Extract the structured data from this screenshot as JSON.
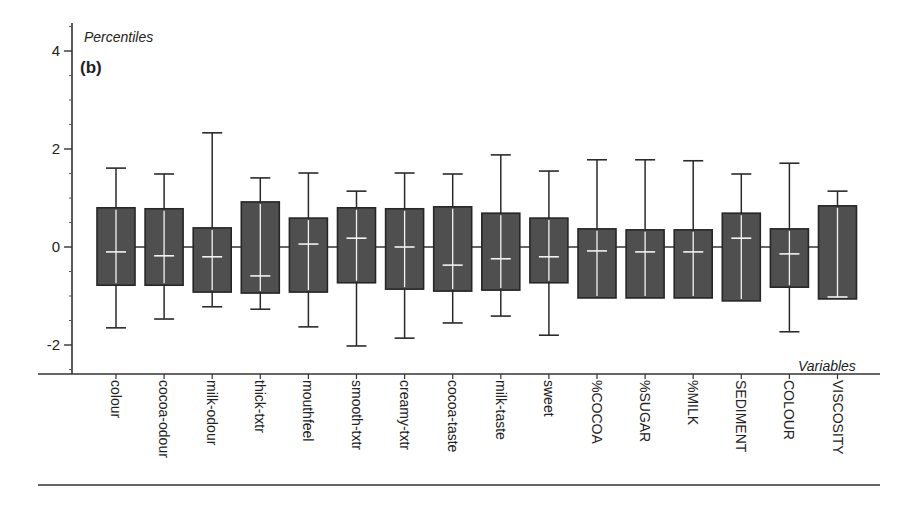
{
  "chart_data": {
    "type": "boxplot",
    "panel_label": "(b)",
    "title": "",
    "ylabel": "Percentiles",
    "xlabel": "Variables",
    "ylim": [
      -2.5,
      4.5
    ],
    "yticks": [
      4,
      2,
      0,
      -2
    ],
    "ytick_labels": [
      "4",
      "2",
      "0",
      "-2"
    ],
    "minor_tick_step": 0.5,
    "grid": false,
    "legend": null,
    "box_fill": "#4f4f4f",
    "box_edge": "#262626",
    "median_color": "#f2f2f2",
    "categories": [
      "colour",
      "cocoa-odour",
      "milk-odour",
      "thick-txtr",
      "mouthfeel",
      "smooth-txtr",
      "creamy-txtr",
      "cocoa-taste",
      "milk-taste",
      "sweet",
      "%COCOA",
      "%SUGAR",
      "%MILK",
      "SEDIMENT",
      "COLOUR",
      "VISCOSITY"
    ],
    "series": [
      {
        "name": "colour",
        "min": -1.65,
        "q1": -0.78,
        "median": -0.1,
        "q3": 0.8,
        "max": 1.61
      },
      {
        "name": "cocoa-odour",
        "min": -1.47,
        "q1": -0.78,
        "median": -0.18,
        "q3": 0.78,
        "max": 1.49
      },
      {
        "name": "milk-odour",
        "min": -1.22,
        "q1": -0.92,
        "median": -0.2,
        "q3": 0.39,
        "max": 2.33
      },
      {
        "name": "thick-txtr",
        "min": -1.27,
        "q1": -0.94,
        "median": -0.59,
        "q3": 0.92,
        "max": 1.41
      },
      {
        "name": "mouthfeel",
        "min": -1.63,
        "q1": -0.92,
        "median": 0.06,
        "q3": 0.59,
        "max": 1.51
      },
      {
        "name": "smooth-txtr",
        "min": -2.02,
        "q1": -0.73,
        "median": 0.18,
        "q3": 0.8,
        "max": 1.14
      },
      {
        "name": "creamy-txtr",
        "min": -1.86,
        "q1": -0.86,
        "median": 0.0,
        "q3": 0.78,
        "max": 1.51
      },
      {
        "name": "cocoa-taste",
        "min": -1.55,
        "q1": -0.9,
        "median": -0.37,
        "q3": 0.82,
        "max": 1.49
      },
      {
        "name": "milk-taste",
        "min": -1.41,
        "q1": -0.88,
        "median": -0.24,
        "q3": 0.69,
        "max": 1.88
      },
      {
        "name": "sweet",
        "min": -1.8,
        "q1": -0.73,
        "median": -0.2,
        "q3": 0.59,
        "max": 1.55
      },
      {
        "name": "%COCOA",
        "min": -1.04,
        "q1": -1.04,
        "median": -0.08,
        "q3": 0.37,
        "max": 1.78
      },
      {
        "name": "%SUGAR",
        "min": -1.04,
        "q1": -1.04,
        "median": -0.1,
        "q3": 0.35,
        "max": 1.78
      },
      {
        "name": "%MILK",
        "min": -1.04,
        "q1": -1.04,
        "median": -0.1,
        "q3": 0.35,
        "max": 1.76
      },
      {
        "name": "SEDIMENT",
        "min": -1.1,
        "q1": -1.1,
        "median": 0.18,
        "q3": 0.69,
        "max": 1.49
      },
      {
        "name": "COLOUR",
        "min": -1.73,
        "q1": -0.82,
        "median": -0.14,
        "q3": 0.37,
        "max": 1.71
      },
      {
        "name": "VISCOSITY",
        "min": -1.06,
        "q1": -1.06,
        "median": -1.02,
        "q3": 0.84,
        "max": 1.14
      }
    ]
  }
}
